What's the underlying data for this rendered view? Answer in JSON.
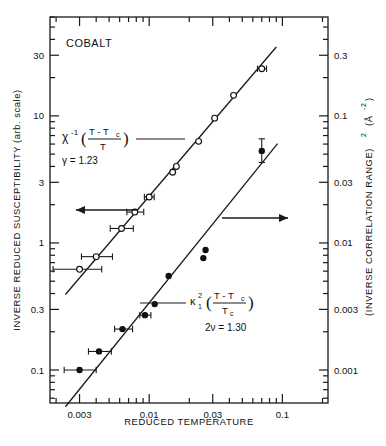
{
  "figure": {
    "panel_label": "COBALT",
    "axes": {
      "x": {
        "label": "REDUCED  TEMPERATURE",
        "scale": "log",
        "range": [
          0.0018,
          0.22
        ],
        "tick_labels": [
          "0.003",
          "0.01",
          "0.03",
          "0.1"
        ],
        "tick_values": [
          0.003,
          0.01,
          0.03,
          0.1
        ]
      },
      "y_left": {
        "label": "INVERSE  REDUCED  SUSCEPTIBILITY  (arb. scale)",
        "scale": "log",
        "range": [
          0.055,
          60
        ],
        "tick_labels": [
          "30",
          "10",
          "3",
          "1",
          "0.3",
          "0.1"
        ],
        "tick_values": [
          30,
          10,
          3,
          1,
          0.3,
          0.1
        ]
      },
      "y_right": {
        "label": "(INVERSE  CORRELATION  RANGE)",
        "label_sup": "2",
        "label_units": "(Å",
        "label_units_sup": "-2",
        "label_units_close": ")",
        "scale": "log",
        "range": [
          0.00055,
          0.6
        ],
        "tick_labels": [
          "0.3",
          "0.1",
          "0.03",
          "0.01",
          "0.003",
          "0.001"
        ],
        "tick_values": [
          0.3,
          0.1,
          0.03,
          0.01,
          0.003,
          0.001
        ]
      }
    },
    "annotations": {
      "susceptibility": {
        "symbol": "χ",
        "exponent": "-1",
        "paren_open": "(",
        "numerator": "T - T",
        "numerator_sub": "c",
        "denominator": "T",
        "paren_close": ")",
        "exponent_line": "γ = 1.23",
        "arrow_direction": "left"
      },
      "correlation": {
        "symbol": "κ",
        "sub": "1",
        "sup": "2",
        "paren_open": "(",
        "numerator": "T - T",
        "numerator_sub": "c",
        "denominator": "T",
        "denominator_sub": "c",
        "paren_close": ")",
        "exponent_line": "2ν = 1.30",
        "arrow_direction": "right"
      }
    }
  },
  "chart_data": {
    "type": "scatter",
    "title": "COBALT",
    "xlabel": "REDUCED  TEMPERATURE",
    "ylabel": "INVERSE  REDUCED  SUSCEPTIBILITY  (arb. scale)",
    "ylabel_right": "(INVERSE  CORRELATION  RANGE)^2  (Å^-2)",
    "xscale": "log",
    "yscale": "log",
    "xlim": [
      0.0018,
      0.22
    ],
    "ylim_left": [
      0.055,
      60
    ],
    "ylim_right": [
      0.00055,
      0.6
    ],
    "grid": false,
    "legend": "inline-annotations",
    "series": [
      {
        "name": "Inverse reduced susceptibility",
        "marker": "open-circle",
        "axis": "left",
        "exponent_label": "γ = 1.23",
        "fit_slope_decades": 1.23,
        "points": [
          {
            "x": 0.003,
            "y": 0.62,
            "xerr_lo": 0.0019,
            "xerr_hi": 0.0044
          },
          {
            "x": 0.004,
            "y": 0.78,
            "xerr_lo": 0.0031,
            "xerr_hi": 0.0053
          },
          {
            "x": 0.0062,
            "y": 1.3,
            "xerr_lo": 0.0051,
            "xerr_hi": 0.0076
          },
          {
            "x": 0.0078,
            "y": 1.75,
            "xerr_lo": 0.0068,
            "xerr_hi": 0.0091
          },
          {
            "x": 0.01,
            "y": 2.3,
            "xerr_lo": 0.0092,
            "xerr_hi": 0.0109
          },
          {
            "x": 0.015,
            "y": 3.6,
            "xerr_lo": null,
            "xerr_hi": null
          },
          {
            "x": 0.016,
            "y": 4.0,
            "xerr_lo": null,
            "xerr_hi": null
          },
          {
            "x": 0.0235,
            "y": 6.3,
            "xerr_lo": null,
            "xerr_hi": null
          },
          {
            "x": 0.031,
            "y": 9.6,
            "xerr_lo": null,
            "xerr_hi": null
          },
          {
            "x": 0.043,
            "y": 14.5,
            "xerr_lo": null,
            "xerr_hi": null
          },
          {
            "x": 0.07,
            "y": 23.5,
            "xerr_lo": 0.065,
            "xerr_hi": 0.076
          }
        ]
      },
      {
        "name": "(Inverse correlation range) squared",
        "marker": "filled-circle",
        "axis": "right",
        "exponent_label": "2ν = 1.30",
        "fit_slope_decades": 1.3,
        "points": [
          {
            "x": 0.003,
            "y": 0.001,
            "xerr_lo": 0.0023,
            "xerr_hi": 0.004
          },
          {
            "x": 0.0042,
            "y": 0.0014,
            "xerr_lo": 0.0035,
            "xerr_hi": 0.0052
          },
          {
            "x": 0.0063,
            "y": 0.0021,
            "xerr_lo": 0.0055,
            "xerr_hi": 0.0075
          },
          {
            "x": 0.0093,
            "y": 0.0027,
            "xerr_lo": 0.0085,
            "xerr_hi": 0.0103
          },
          {
            "x": 0.011,
            "y": 0.0033,
            "xerr_lo": null,
            "xerr_hi": null
          },
          {
            "x": 0.014,
            "y": 0.0055,
            "xerr_lo": null,
            "xerr_hi": null
          },
          {
            "x": 0.0255,
            "y": 0.0076,
            "xerr_lo": null,
            "xerr_hi": null
          },
          {
            "x": 0.0265,
            "y": 0.0088,
            "xerr_lo": null,
            "xerr_hi": null
          },
          {
            "x": 0.07,
            "y": 0.053,
            "yerr_lo": 0.043,
            "yerr_hi": 0.066
          }
        ]
      }
    ]
  }
}
